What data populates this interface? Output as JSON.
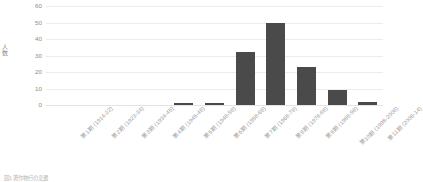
{
  "chart_data": {
    "type": "bar",
    "title": "",
    "xlabel": "",
    "ylabel": "人数",
    "ylim": [
      0,
      60
    ],
    "yticks": [
      0,
      10,
      20,
      30,
      40,
      50,
      60
    ],
    "grid": true,
    "legend": null,
    "bar_color": "#4a4a4a",
    "categories": [
      "第1期 (1914-22)",
      "第2期 (1923-34)",
      "第3期 (1934-45)",
      "第4期 (1945-48)",
      "第5期 (1948-58)",
      "第6期 (1958-68)",
      "第7期 (1968-78)",
      "第8期 (1978-88)",
      "第9期 (1988-98)",
      "第10期 (1998-2008)",
      "第11期 (2008-14)"
    ],
    "values": [
      0,
      0,
      0,
      0,
      1,
      1,
      32,
      50,
      23,
      9,
      2
    ]
  },
  "caption": "図1 著作物行の変遷",
  "axes": {
    "y_title": "人数"
  }
}
